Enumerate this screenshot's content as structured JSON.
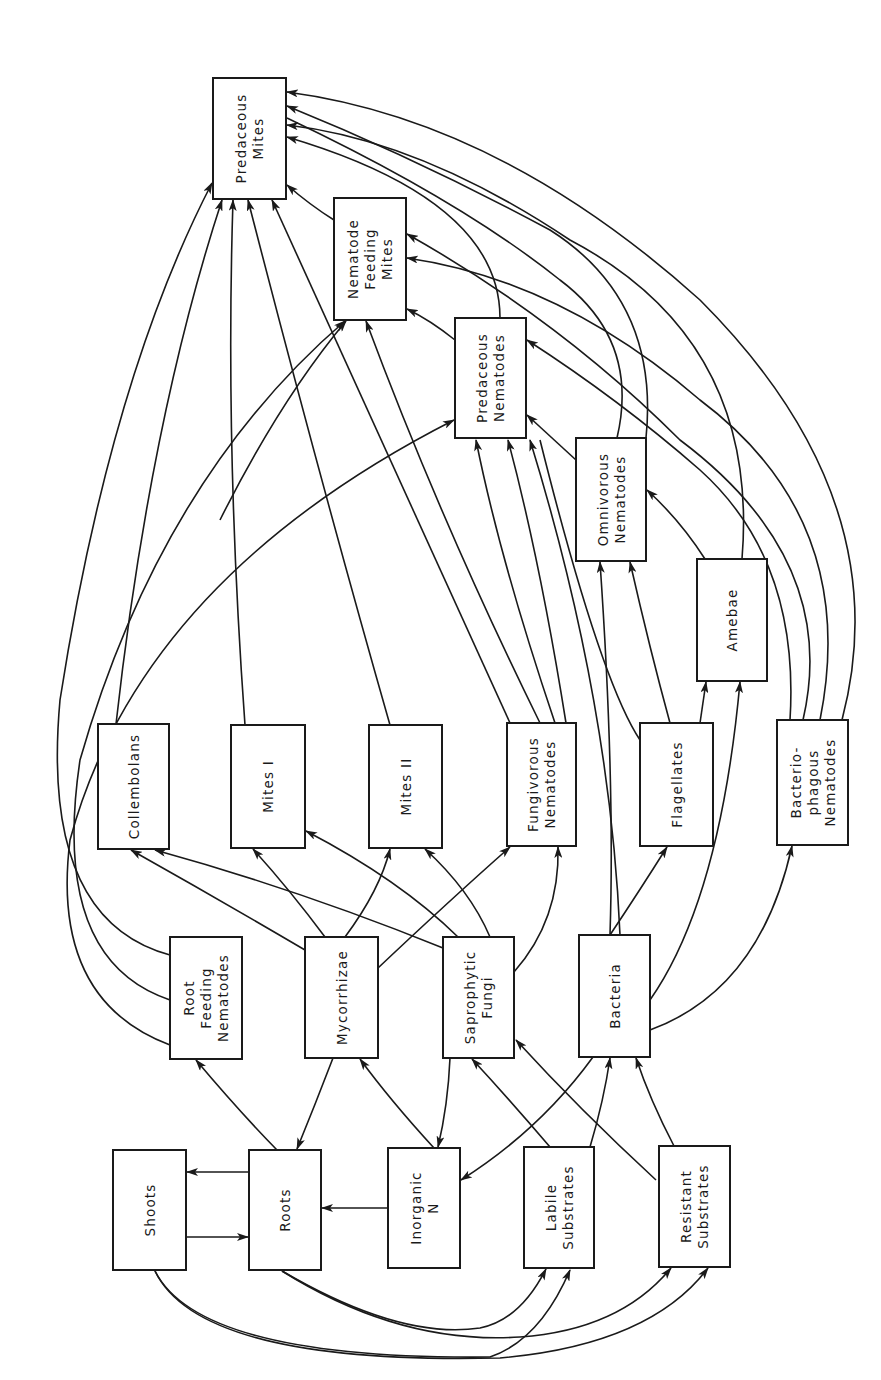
{
  "figure": {
    "type": "soil-food-web",
    "orientation": "rotated-90-ccw",
    "line_color": "#1a1a1a",
    "background": "#ffffff"
  },
  "nodes": [
    {
      "id": "predaceous-mites",
      "lines": [
        "Predaceous",
        "Mites"
      ],
      "x": 213,
      "y": 78,
      "w": 73,
      "h": 121
    },
    {
      "id": "nematode-feeding-mites",
      "lines": [
        "Nematode",
        "Feeding",
        "Mites"
      ],
      "x": 334,
      "y": 198,
      "w": 72,
      "h": 122
    },
    {
      "id": "predaceous-nematodes",
      "lines": [
        "Predaceous",
        "Nematodes"
      ],
      "x": 455,
      "y": 318,
      "w": 71,
      "h": 120
    },
    {
      "id": "omnivorous-nematodes",
      "lines": [
        "Omnivorous",
        "Nematodes"
      ],
      "x": 576,
      "y": 438,
      "w": 70,
      "h": 123
    },
    {
      "id": "amebae",
      "lines": [
        "Amebae"
      ],
      "x": 697,
      "y": 559,
      "w": 70,
      "h": 122
    },
    {
      "id": "collembolans",
      "lines": [
        "Collembolans"
      ],
      "x": 98,
      "y": 724,
      "w": 71,
      "h": 125
    },
    {
      "id": "mites-i",
      "lines": [
        "Mites I"
      ],
      "x": 231,
      "y": 725,
      "w": 74,
      "h": 123
    },
    {
      "id": "mites-ii",
      "lines": [
        "Mites II"
      ],
      "x": 369,
      "y": 725,
      "w": 73,
      "h": 123
    },
    {
      "id": "fungivorous-nematodes",
      "lines": [
        "Fungivorous",
        "Nematodes"
      ],
      "x": 507,
      "y": 723,
      "w": 69,
      "h": 123
    },
    {
      "id": "flagellates",
      "lines": [
        "Flagellates"
      ],
      "x": 640,
      "y": 723,
      "w": 73,
      "h": 123
    },
    {
      "id": "bacteriophagous-nematodes",
      "lines": [
        "Bacterio-",
        "phagous",
        "Nematodes"
      ],
      "x": 777,
      "y": 720,
      "w": 71,
      "h": 125
    },
    {
      "id": "root-feeding-nematodes",
      "lines": [
        "Root",
        "Feeding",
        "Nematodes"
      ],
      "x": 170,
      "y": 937,
      "w": 72,
      "h": 122
    },
    {
      "id": "mycorrhizae",
      "lines": [
        "Mycorrhizae"
      ],
      "x": 305,
      "y": 937,
      "w": 73,
      "h": 121
    },
    {
      "id": "saprophytic-fungi",
      "lines": [
        "Saprophytic",
        "Fungi"
      ],
      "x": 443,
      "y": 937,
      "w": 71,
      "h": 121
    },
    {
      "id": "bacteria",
      "lines": [
        "Bacteria"
      ],
      "x": 579,
      "y": 935,
      "w": 71,
      "h": 122
    },
    {
      "id": "shoots",
      "lines": [
        "Shoots"
      ],
      "x": 113,
      "y": 1150,
      "w": 73,
      "h": 120
    },
    {
      "id": "roots",
      "lines": [
        "Roots"
      ],
      "x": 249,
      "y": 1150,
      "w": 72,
      "h": 120
    },
    {
      "id": "inorganic-n",
      "lines": [
        "Inorganic",
        "N"
      ],
      "x": 388,
      "y": 1148,
      "w": 72,
      "h": 120
    },
    {
      "id": "labile-substrates",
      "lines": [
        "Labile",
        "Substrates"
      ],
      "x": 524,
      "y": 1147,
      "w": 70,
      "h": 121
    },
    {
      "id": "resistant-substrates",
      "lines": [
        "Resistant",
        "Substrates"
      ],
      "x": 659,
      "y": 1146,
      "w": 71,
      "h": 121
    }
  ],
  "edges": [
    {
      "from": "roots",
      "to": "shoots",
      "d": "M249,1172 L187,1172",
      "arrow": true
    },
    {
      "from": "shoots",
      "to": "roots",
      "d": "M187,1237 L248,1237",
      "arrow": true
    },
    {
      "from": "inorganic-n",
      "to": "roots",
      "d": "M388,1208 L322,1208",
      "arrow": true
    },
    {
      "from": "roots",
      "to": "root-feeding-nematodes",
      "d": "M277,1150 Q238,1110 196,1060",
      "arrow": true
    },
    {
      "from": "mycorrhizae",
      "to": "roots",
      "d": "M333,1058 Q315,1105 297,1149",
      "arrow": true
    },
    {
      "from": "inorganic-n",
      "to": "mycorrhizae",
      "d": "M434,1148 Q390,1100 360,1059",
      "arrow": true
    },
    {
      "from": "saprophytic-fungi",
      "to": "inorganic-n",
      "d": "M450,1058 Q448,1105 438,1147",
      "arrow": true
    },
    {
      "from": "bacteria",
      "to": "inorganic-n",
      "d": "M593,1057 Q540,1130 461,1180",
      "arrow": true
    },
    {
      "from": "labile-substrates",
      "to": "saprophytic-fungi",
      "d": "M550,1147 Q510,1100 472,1059",
      "arrow": true
    },
    {
      "from": "resistant-substrates",
      "to": "saprophytic-fungi",
      "d": "M656,1180 Q580,1110 516,1040",
      "arrow": true
    },
    {
      "from": "labile-substrates",
      "to": "bacteria",
      "d": "M590,1147 Q604,1100 610,1058",
      "arrow": true
    },
    {
      "from": "resistant-substrates",
      "to": "bacteria",
      "d": "M674,1146 Q650,1100 636,1058",
      "arrow": true
    },
    {
      "from": "roots",
      "to": "labile-substrates",
      "d": "M282,1271 Q400,1340 480,1328 Q520,1320 546,1269",
      "arrow": true
    },
    {
      "from": "roots",
      "to": "resistant-substrates",
      "d": "M282,1271 Q400,1345 520,1337 Q620,1330 671,1268",
      "arrow": true
    },
    {
      "from": "shoots",
      "to": "labile-substrates",
      "d": "M155,1271 Q200,1360 490,1357 Q540,1340 570,1270",
      "arrow": true
    },
    {
      "from": "shoots",
      "to": "resistant-substrates",
      "d": "M155,1271 Q200,1365 500,1358 Q650,1345 708,1268",
      "arrow": true
    },
    {
      "from": "root-feeding-nematodes",
      "to": "predaceous-mites",
      "d": "M170,955 Q40,920 60,700 Q110,380 212,183",
      "arrow": true
    },
    {
      "from": "root-feeding-nematodes",
      "to": "nematode-feeding-mites",
      "d": "M170,1000 Q50,960 80,760 Q160,480 345,321",
      "arrow": true
    },
    {
      "from": "root-feeding-nematodes",
      "to": "predaceous-nematodes",
      "d": "M170,1045 Q50,1000 70,840 Q140,580 454,420",
      "arrow": true
    },
    {
      "from": "mycorrhizae",
      "to": "collembolans",
      "d": "M305,950 Q220,900 131,850",
      "arrow": true
    },
    {
      "from": "mycorrhizae",
      "to": "mites-i",
      "d": "M325,937 Q290,890 253,849",
      "arrow": true
    },
    {
      "from": "mycorrhizae",
      "to": "mites-ii",
      "d": "M345,937 Q380,890 390,849",
      "arrow": true
    },
    {
      "from": "mycorrhizae",
      "to": "fungivorous-nematodes",
      "d": "M378,968 Q450,900 510,847",
      "arrow": true
    },
    {
      "from": "saprophytic-fungi",
      "to": "collembolans",
      "d": "M443,948 Q300,890 155,850",
      "arrow": true
    },
    {
      "from": "saprophytic-fungi",
      "to": "mites-i",
      "d": "M458,937 Q400,880 306,831",
      "arrow": true
    },
    {
      "from": "saprophytic-fungi",
      "to": "mites-ii",
      "d": "M490,937 Q470,890 425,849",
      "arrow": true
    },
    {
      "from": "saprophytic-fungi",
      "to": "fungivorous-nematodes",
      "d": "M514,972 Q560,920 558,847",
      "arrow": true
    },
    {
      "from": "bacteria",
      "to": "flagellates",
      "d": "M610,935 Q640,890 667,847",
      "arrow": true
    },
    {
      "from": "bacteria",
      "to": "amebae",
      "d": "M650,1000 Q720,900 740,682",
      "arrow": true
    },
    {
      "from": "bacteria",
      "to": "bacteriophagous-nematodes",
      "d": "M650,1030 Q760,990 792,846",
      "arrow": true
    },
    {
      "from": "bacteria",
      "to": "omnivorous-nematodes",
      "d": "M610,935 Q615,780 600,562",
      "arrow": true
    },
    {
      "from": "bacteria",
      "to": "predaceous-nematodes",
      "d": "M620,935 Q610,700 530,440",
      "arrow": true
    },
    {
      "from": "flagellates",
      "to": "amebae",
      "d": "M700,723 L706,682",
      "arrow": true
    },
    {
      "from": "flagellates",
      "to": "omnivorous-nematodes",
      "d": "M670,723 Q650,650 630,562",
      "arrow": true
    },
    {
      "from": "flagellates",
      "to": "predaceous-nematodes",
      "d": "M640,740 Q600,680 540,440",
      "arrow": false
    },
    {
      "from": "amebae",
      "to": "omnivorous-nematodes",
      "d": "M705,559 Q680,520 647,490",
      "arrow": true
    },
    {
      "from": "amebae",
      "to": "predaceous-mites",
      "d": "M742,559 Q760,340 570,240 Q420,140 287,125",
      "arrow": true
    },
    {
      "from": "bacteriophagous-nematodes",
      "to": "predaceous-mites",
      "d": "M842,720 Q900,500 700,300 Q500,120 287,92",
      "arrow": true
    },
    {
      "from": "bacteriophagous-nematodes",
      "to": "nematode-feeding-mites",
      "d": "M820,720 Q860,520 700,400 Q560,280 407,258",
      "arrow": true
    },
    {
      "from": "bacteriophagous-nematodes",
      "to": "nematode-feeding-mites",
      "d": "M803,720 Q840,560 680,440 Q560,320 407,234",
      "arrow": true
    },
    {
      "from": "bacteriophagous-nematodes",
      "to": "predaceous-nematodes",
      "d": "M790,720 Q800,560 700,470 Q620,400 527,340",
      "arrow": true
    },
    {
      "from": "omnivorous-nematodes",
      "to": "predaceous-nematodes",
      "d": "M576,460 L527,415",
      "arrow": true
    },
    {
      "from": "omnivorous-nematodes",
      "to": "predaceous-mites",
      "d": "M646,438 Q660,300 550,230 Q420,160 287,106",
      "arrow": true
    },
    {
      "from": "omnivorous-nematodes",
      "to": "predaceous-mites-b",
      "d": "M617,438 Q640,340 560,280 Q460,200 287,118",
      "arrow": false
    },
    {
      "from": "predaceous-nematodes",
      "to": "nematode-feeding-mites",
      "d": "M455,340 Q430,320 407,309",
      "arrow": true
    },
    {
      "from": "predaceous-nematodes",
      "to": "predaceous-mites",
      "d": "M500,318 Q500,200 287,137",
      "arrow": true
    },
    {
      "from": "nematode-feeding-mites",
      "to": "predaceous-mites",
      "d": "M334,220 Q310,205 287,185",
      "arrow": true
    },
    {
      "from": "collembolans",
      "to": "predaceous-mites",
      "d": "M116,724 Q150,420 222,200",
      "arrow": true
    },
    {
      "from": "mites-i",
      "to": "predaceous-mites",
      "d": "M245,725 Q225,450 233,200",
      "arrow": true
    },
    {
      "from": "mites-ii",
      "to": "predaceous-mites",
      "d": "M390,725 Q320,480 248,200",
      "arrow": true
    },
    {
      "from": "fungivorous-nematodes",
      "to": "predaceous-mites",
      "d": "M510,723 Q400,480 272,200",
      "arrow": true
    },
    {
      "from": "fungivorous-nematodes",
      "to": "nematode-feeding-mites",
      "d": "M540,723 Q440,520 366,321",
      "arrow": true
    },
    {
      "from": "fungivorous-nematodes",
      "to": "predaceous-nematodes",
      "d": "M555,723 Q500,560 476,440",
      "arrow": true
    },
    {
      "from": "fungivorous-nematodes",
      "to": "predaceous-nematodes-b",
      "d": "M566,723 Q540,560 508,440",
      "arrow": true
    },
    {
      "from": "mycorrhizae",
      "to": "nematode-feeding-mites",
      "d": "M220,520 Q280,400 346,321",
      "arrow": true
    }
  ]
}
